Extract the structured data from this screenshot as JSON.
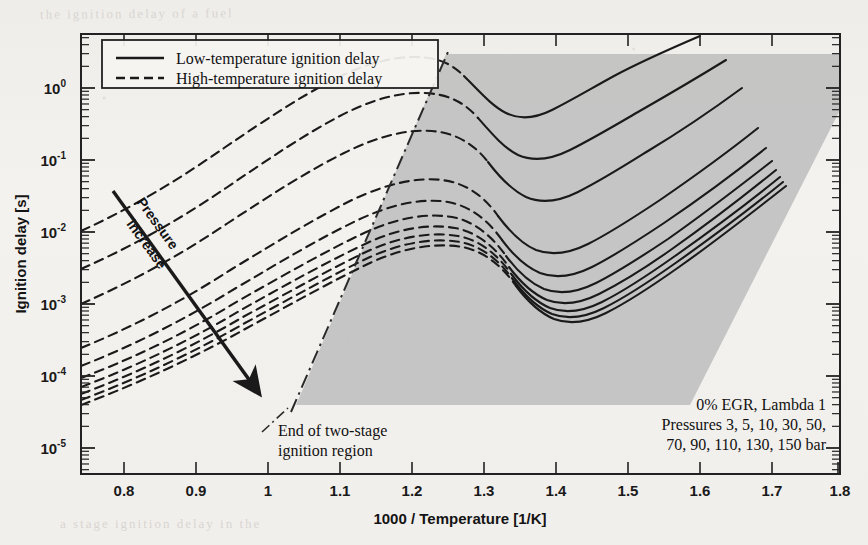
{
  "chart_data": {
    "type": "line",
    "title": "",
    "xlabel": "1000 / Temperature [1/K]",
    "ylabel": "Ignition delay [s]",
    "xlim": [
      0.77,
      1.815
    ],
    "ylim": [
      4.4e-06,
      5.6
    ],
    "xticks": [
      "0.8",
      "0.9",
      "1",
      "1.1",
      "1.2",
      "1.3",
      "1.4",
      "1.5",
      "1.6",
      "1.7",
      "1.8"
    ],
    "xtick_values": [
      0.8,
      0.9,
      1.0,
      1.1,
      1.2,
      1.3,
      1.4,
      1.5,
      1.6,
      1.7,
      1.8
    ],
    "ytick_mantissa": [
      "10",
      "10",
      "10",
      "10",
      "10",
      "10"
    ],
    "ytick_exponents": [
      "0",
      "-1",
      "-2",
      "-3",
      "-4",
      "-5"
    ],
    "ytick_values": [
      1,
      0.1,
      0.01,
      0.001,
      0.0001,
      1e-05
    ],
    "y_scale": "log",
    "grid": false,
    "legend_position": "top-left",
    "legend": [
      {
        "label": "Low-temperature ignition delay",
        "style": "solid"
      },
      {
        "label": "High-temperature ignition delay",
        "style": "dashed"
      }
    ],
    "series_note": "Ten pressure curves; each has a dashed high-temperature branch at low 1000/T and a solid low-temperature branch right of the two-stage boundary.",
    "pressures_bar": [
      3,
      5,
      10,
      30,
      50,
      70,
      90,
      110,
      130,
      150
    ],
    "pressure_unit": "bar",
    "series": [
      {
        "name": "3 bar",
        "style": "dashed-then-solid",
        "x": [
          0.78,
          0.9,
          1.0,
          1.1,
          1.18,
          1.26,
          1.32,
          1.4,
          1.48,
          1.56,
          1.64,
          1.72,
          1.78
        ],
        "y": [
          0.0105,
          0.046,
          0.14,
          0.42,
          0.8,
          1.05,
          1.0,
          0.7,
          0.5,
          0.52,
          0.75,
          1.3,
          2.0
        ]
      },
      {
        "name": "5 bar",
        "style": "dashed-then-solid",
        "x": [
          0.78,
          0.9,
          1.0,
          1.1,
          1.18,
          1.26,
          1.34,
          1.42,
          1.5,
          1.58,
          1.66,
          1.73,
          1.78
        ],
        "y": [
          0.0046,
          0.019,
          0.06,
          0.17,
          0.3,
          0.36,
          0.3,
          0.2,
          0.16,
          0.19,
          0.3,
          0.55,
          0.9
        ]
      },
      {
        "name": "10 bar",
        "style": "dashed-then-solid",
        "x": [
          0.78,
          0.9,
          1.0,
          1.1,
          1.2,
          1.28,
          1.36,
          1.44,
          1.52,
          1.6,
          1.68,
          1.74,
          1.78
        ],
        "y": [
          0.0015,
          0.0056,
          0.017,
          0.046,
          0.09,
          0.1,
          0.08,
          0.054,
          0.046,
          0.056,
          0.09,
          0.16,
          0.24
        ]
      },
      {
        "name": "30 bar",
        "style": "dashed-then-solid",
        "x": [
          0.78,
          0.9,
          1.0,
          1.1,
          1.2,
          1.3,
          1.38,
          1.46,
          1.54,
          1.62,
          1.7,
          1.76,
          1.79
        ],
        "y": [
          0.0004,
          0.0013,
          0.0036,
          0.009,
          0.017,
          0.02,
          0.016,
          0.011,
          0.009,
          0.011,
          0.019,
          0.032,
          0.044
        ]
      },
      {
        "name": "50 bar",
        "style": "dashed-then-solid",
        "x": [
          0.78,
          0.9,
          1.0,
          1.1,
          1.2,
          1.3,
          1.4,
          1.48,
          1.56,
          1.64,
          1.71,
          1.77,
          1.79
        ],
        "y": [
          0.00023,
          0.0007,
          0.0018,
          0.0042,
          0.008,
          0.01,
          0.0082,
          0.0056,
          0.0046,
          0.0056,
          0.009,
          0.015,
          0.02
        ]
      },
      {
        "name": "70 bar",
        "style": "dashed-then-solid",
        "x": [
          0.78,
          0.9,
          1.0,
          1.1,
          1.2,
          1.3,
          1.4,
          1.5,
          1.58,
          1.66,
          1.73,
          1.78,
          1.8
        ],
        "y": [
          0.00016,
          0.00046,
          0.00115,
          0.0026,
          0.0048,
          0.0062,
          0.0052,
          0.0034,
          0.0028,
          0.0034,
          0.0054,
          0.0086,
          0.011
        ]
      },
      {
        "name": "90 bar",
        "style": "dashed-then-solid",
        "x": [
          0.78,
          0.9,
          1.0,
          1.1,
          1.2,
          1.3,
          1.4,
          1.5,
          1.6,
          1.68,
          1.74,
          1.79,
          1.8
        ],
        "y": [
          0.00012,
          0.00033,
          0.0008,
          0.0018,
          0.0032,
          0.0042,
          0.0036,
          0.0023,
          0.0019,
          0.0023,
          0.0034,
          0.0054,
          0.0066
        ]
      },
      {
        "name": "110 bar",
        "style": "dashed-then-solid",
        "x": [
          0.78,
          0.9,
          1.0,
          1.1,
          1.2,
          1.3,
          1.4,
          1.5,
          1.6,
          1.7,
          1.76,
          1.8,
          1.81
        ],
        "y": [
          9.6e-05,
          0.00026,
          0.0006,
          0.0013,
          0.0023,
          0.003,
          0.0026,
          0.0017,
          0.0013,
          0.0016,
          0.0024,
          0.0038,
          0.0044
        ]
      },
      {
        "name": "130 bar",
        "style": "dashed-then-solid",
        "x": [
          0.78,
          0.9,
          1.0,
          1.1,
          1.2,
          1.3,
          1.4,
          1.5,
          1.6,
          1.7,
          1.77,
          1.81,
          1.81
        ],
        "y": [
          8e-05,
          0.00021,
          0.00048,
          0.001,
          0.0018,
          0.0023,
          0.002,
          0.0013,
          0.001,
          0.00125,
          0.0019,
          0.003,
          0.0034
        ]
      },
      {
        "name": "150 bar",
        "style": "dashed-then-solid",
        "x": [
          0.78,
          0.9,
          1.0,
          1.1,
          1.2,
          1.3,
          1.4,
          1.5,
          1.6,
          1.7,
          1.78,
          1.81,
          1.81
        ],
        "y": [
          6.8e-05,
          0.000175,
          0.00039,
          0.00082,
          0.00145,
          0.00185,
          0.0016,
          0.00105,
          0.00082,
          0.001,
          0.00155,
          0.0025,
          0.0028
        ]
      }
    ],
    "shaded_region": {
      "label": "two-stage ignition region",
      "fill_color": "#bdbdbd",
      "boundary_style": "dash-dot",
      "boundary_label": "End of two-stage ignition region"
    },
    "annotations": [
      {
        "name": "pressure-increase",
        "text_line1": "Pressure",
        "text_line2": "increase",
        "arrow": "down-right"
      },
      {
        "name": "boundary-callout",
        "text_line1": "End of two-stage",
        "text_line2": "ignition region"
      },
      {
        "name": "conditions",
        "line1": "0% EGR, Lambda 1",
        "line2": "Pressures 3, 5, 10, 30, 50,",
        "line3": "70, 90, 110, 130, 150 bar"
      }
    ]
  },
  "axes": {
    "x_title": "1000 / Temperature [1/K]",
    "y_title": "Ignition delay [s]"
  },
  "legend": {
    "low_temp_label": "Low-temperature ignition delay",
    "high_temp_label": "High-temperature ignition delay"
  },
  "annotations": {
    "pressure_line1": "Pressure",
    "pressure_line2": "increase",
    "boundary_line1": "End of two-stage",
    "boundary_line2": "ignition region",
    "conditions_line1": "0% EGR, Lambda 1",
    "conditions_line2": "Pressures 3, 5, 10, 30, 50,",
    "conditions_line3": "70, 90, 110, 130, 150 bar"
  },
  "colors": {
    "curve": "#1a1a1a",
    "shade": "#bdbdbd",
    "frame": "#222222",
    "paper": "#f3f1ee"
  },
  "ghost_text": {
    "top": "the ignition delay of a fuel",
    "bottom": "a stage ignition  delay  in the",
    "left": "of",
    "right": "is"
  }
}
